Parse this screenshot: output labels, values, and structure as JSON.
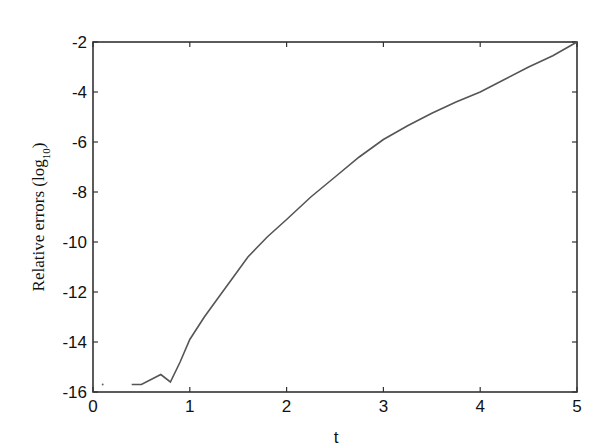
{
  "chart_data": {
    "type": "line",
    "title": "",
    "xlabel": "t",
    "ylabel": "Relative errors (log10)",
    "ylabel_display": "Relative errors (log",
    "ylabel_sub": "10",
    "ylabel_close": ")",
    "xlim": [
      0,
      5
    ],
    "ylim": [
      -16,
      -2
    ],
    "xticks": [
      0,
      1,
      2,
      3,
      4,
      5
    ],
    "yticks": [
      -2,
      -4,
      -6,
      -8,
      -10,
      -12,
      -14,
      -16
    ],
    "grid": false,
    "legend": null,
    "series": [
      {
        "name": "relative error",
        "color": "#555555",
        "x": [
          0.4,
          0.5,
          0.7,
          0.8,
          0.9,
          1.0,
          1.15,
          1.3,
          1.45,
          1.6,
          1.8,
          2.0,
          2.25,
          2.5,
          2.75,
          3.0,
          3.25,
          3.5,
          3.75,
          4.0,
          4.25,
          4.5,
          4.75,
          5.0
        ],
        "y": [
          -15.7,
          -15.7,
          -15.3,
          -15.6,
          -14.8,
          -13.9,
          -13.0,
          -12.2,
          -11.4,
          -10.6,
          -9.8,
          -9.1,
          -8.2,
          -7.4,
          -6.6,
          -5.9,
          -5.35,
          -4.85,
          -4.4,
          -4.0,
          -3.5,
          -3.0,
          -2.55,
          -2.0
        ]
      }
    ],
    "annotations": [
      {
        "type": "dot",
        "x": 0.1,
        "y": -15.7
      }
    ]
  }
}
